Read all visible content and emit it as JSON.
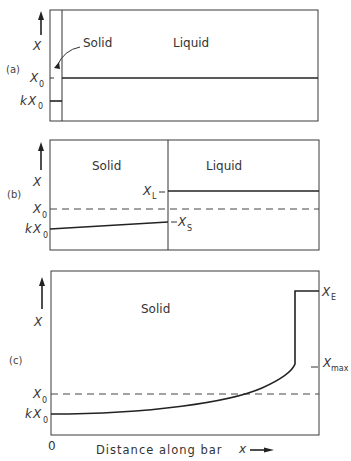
{
  "figure": {
    "type": "zone-refining concentration profile diagram",
    "colors": {
      "ink": "#222222",
      "background": "#ffffff"
    },
    "x_axis": {
      "origin_label": "0",
      "label": "Distance along bar",
      "variable": "x"
    },
    "y_axis": {
      "variable": "X"
    },
    "panels": [
      {
        "id": "a",
        "label": "(a)",
        "y_symbol": "X",
        "regions": [
          "Solid",
          "Liquid"
        ],
        "levels": {
          "X0": {
            "base": "X",
            "sub": "0"
          },
          "kX0": {
            "prefix": "k",
            "base": "X",
            "sub": "0"
          }
        }
      },
      {
        "id": "b",
        "label": "(b)",
        "y_symbol": "X",
        "regions": [
          "Solid",
          "Liquid"
        ],
        "levels": {
          "XL": {
            "base": "X",
            "sub": "L"
          },
          "X0": {
            "base": "X",
            "sub": "0"
          },
          "kX0": {
            "prefix": "k",
            "base": "X",
            "sub": "0"
          },
          "XS": {
            "base": "X",
            "sub": "S"
          }
        }
      },
      {
        "id": "c",
        "label": "(c)",
        "y_symbol": "X",
        "regions": [
          "Solid"
        ],
        "levels": {
          "XE": {
            "base": "X",
            "sub": "E"
          },
          "Xmax": {
            "base": "X",
            "sub": "max"
          },
          "X0": {
            "base": "X",
            "sub": "0"
          },
          "kX0": {
            "prefix": "k",
            "base": "X",
            "sub": "0"
          }
        }
      }
    ]
  },
  "labels": {
    "a": {
      "panel": "(a)",
      "y": "X",
      "solid": "Solid",
      "liquid": "Liquid",
      "x0": "X",
      "x0_sub": "0",
      "kx0_k": "k",
      "kx0": "X",
      "kx0_sub": "0"
    },
    "b": {
      "panel": "(b)",
      "y": "X",
      "solid": "Solid",
      "liquid": "Liquid",
      "xl": "X",
      "xl_sub": "L",
      "x0": "X",
      "x0_sub": "0",
      "kx0_k": "k",
      "kx0": "X",
      "kx0_sub": "0",
      "xs": "X",
      "xs_sub": "S"
    },
    "c": {
      "panel": "(c)",
      "y": "X",
      "solid": "Solid",
      "xe": "X",
      "xe_sub": "E",
      "xmax": "X",
      "xmax_sub": "max",
      "x0": "X",
      "x0_sub": "0",
      "kx0_k": "k",
      "kx0": "X",
      "kx0_sub": "0"
    },
    "axis": {
      "origin": "0",
      "text": "Distance along bar",
      "var": "x"
    }
  }
}
